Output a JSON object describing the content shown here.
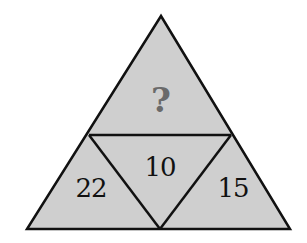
{
  "puzzle": {
    "type": "triangle-number-puzzle",
    "colors": {
      "fill": "#cfcfcf",
      "stroke": "#111111",
      "number_text": "#111111",
      "question_text": "#6a6a6a"
    },
    "cells": {
      "top": {
        "label": "?",
        "position": "top"
      },
      "bottom_left": {
        "label": "22",
        "position": "bottom-left"
      },
      "center": {
        "label": "10",
        "position": "center-inverted"
      },
      "bottom_right": {
        "label": "15",
        "position": "bottom-right"
      }
    }
  }
}
